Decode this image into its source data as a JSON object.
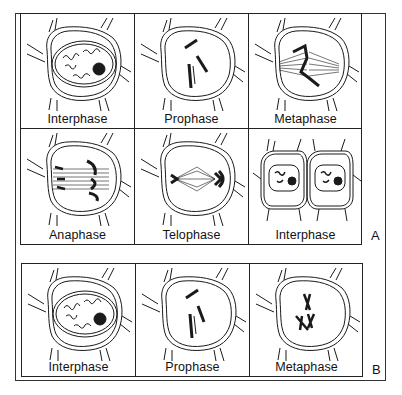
{
  "figure": {
    "series": [
      {
        "id": "A",
        "label": "A",
        "cells": [
          {
            "stage": "Interphase",
            "drawing": "interphase-nucleus-icon"
          },
          {
            "stage": "Prophase",
            "drawing": "prophase-chromosomes-icon"
          },
          {
            "stage": "Metaphase",
            "drawing": "metaphase-spindle-icon"
          },
          {
            "stage": "Anaphase",
            "drawing": "anaphase-spindle-icon"
          },
          {
            "stage": "Telophase",
            "drawing": "telophase-spindle-icon"
          },
          {
            "stage": "Interphase",
            "drawing": "two-daughter-cells-icon"
          }
        ]
      },
      {
        "id": "B",
        "label": "B",
        "cells": [
          {
            "stage": "Interphase",
            "drawing": "interphase-nucleus-icon"
          },
          {
            "stage": "Prophase",
            "drawing": "prophase-chromosomes-icon"
          },
          {
            "stage": "Metaphase",
            "drawing": "metaphase-x-chromosomes-icon"
          }
        ]
      }
    ]
  },
  "colors": {
    "ink": "#1a1a1a",
    "background": "#ffffff",
    "frame": "#222222"
  }
}
